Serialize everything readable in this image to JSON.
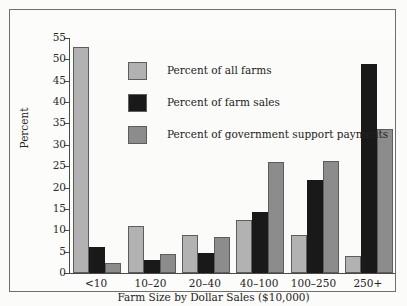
{
  "chart_data": {
    "type": "bar",
    "title": "",
    "xlabel": "Farm Size by Dollar Sales ($10,000)",
    "ylabel": "Percent",
    "categories": [
      "<10",
      "10–20",
      "20–40",
      "40–100",
      "100–250",
      "250+"
    ],
    "series": [
      {
        "name": "Percent of all farms",
        "color": "#b2b2b2",
        "values": [
          53,
          11,
          9,
          12.5,
          9,
          4
        ]
      },
      {
        "name": "Percent of farm sales",
        "color": "#191919",
        "values": [
          6,
          3,
          4.7,
          14.3,
          21.7,
          49
        ]
      },
      {
        "name": "Percent of government support payments",
        "color": "#8c8c8c",
        "values": [
          2.3,
          4.4,
          8.5,
          26,
          26.3,
          33.8
        ]
      }
    ],
    "ylim": [
      0,
      55
    ],
    "yticks": [
      0,
      5,
      10,
      15,
      20,
      25,
      30,
      35,
      40,
      45,
      50,
      55
    ],
    "ytick_labels": [
      "0",
      "5",
      "10",
      "15",
      "20",
      "25",
      "30",
      "35",
      "40",
      "45",
      "50",
      "55"
    ],
    "grid": false,
    "legend_position": "upper-center"
  }
}
